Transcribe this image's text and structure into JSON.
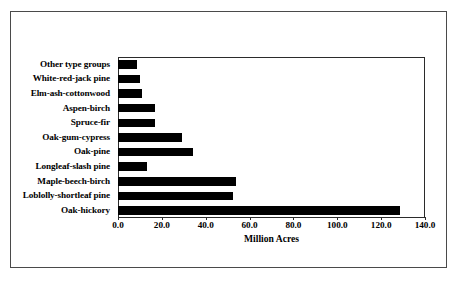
{
  "chart_data": {
    "type": "bar",
    "orientation": "horizontal",
    "title": "",
    "xlabel": "Million Acres",
    "ylabel": "",
    "xlim": [
      0.0,
      140.0
    ],
    "xticks": [
      "0.0",
      "20.0",
      "40.0",
      "60.0",
      "80.0",
      "100.0",
      "120.0",
      "140.0"
    ],
    "xtick_values": [
      0,
      20,
      40,
      60,
      80,
      100,
      120,
      140
    ],
    "grid": false,
    "legend": null,
    "bar_color": "#000000",
    "categories": [
      "Other type groups",
      "White-red-jack pine",
      "Elm-ash-cottonwood",
      "Aspen-birch",
      "Spruce-fir",
      "Oak-gum-cypress",
      "Oak-pine",
      "Longleaf-slash pine",
      "Maple-beech-birch",
      "Loblolly-shortleaf pine",
      "Oak-hickory"
    ],
    "values": [
      8.5,
      10.0,
      11.0,
      17.0,
      17.0,
      29.0,
      34.0,
      13.0,
      54.0,
      52.5,
      128.5
    ]
  },
  "colors": {
    "bar": "#000000",
    "frame": "#2b2b2b",
    "outer_border": "#4a4a4a",
    "background": "#ffffff",
    "text": "#000000"
  }
}
